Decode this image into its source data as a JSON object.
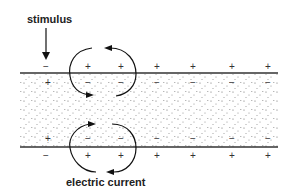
{
  "labels": {
    "stimulus": "stimulus",
    "current": "electric current"
  },
  "membrane": {
    "top_outside": [
      "−",
      "+",
      "+",
      "+",
      "+",
      "+",
      "+"
    ],
    "top_inside": [
      "+",
      "−",
      "−",
      "−",
      "−",
      "−",
      "−"
    ],
    "bottom_inside": [
      "+",
      "−",
      "−",
      "−",
      "−",
      "−",
      "−"
    ],
    "bottom_outside": [
      "−",
      "+",
      "+",
      "+",
      "+",
      "+",
      "+"
    ]
  },
  "colors": {
    "line": "#333333",
    "stipple": "#555555",
    "background": "#ffffff"
  }
}
